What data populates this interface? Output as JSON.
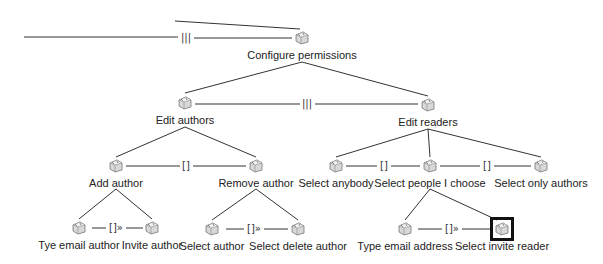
{
  "diagram": {
    "type": "feature-tree",
    "selected_node": "Select invite reader",
    "nodes": [
      {
        "id": "root",
        "label": "Configure permissions",
        "x": 302,
        "y": 38
      },
      {
        "id": "edit_authors",
        "label": "Edit authors",
        "x": 185,
        "y": 103
      },
      {
        "id": "edit_readers",
        "label": "Edit readers",
        "x": 428,
        "y": 105
      },
      {
        "id": "add_author",
        "label": "Add author",
        "x": 116,
        "y": 166
      },
      {
        "id": "remove_author",
        "label": "Remove author",
        "x": 256,
        "y": 166
      },
      {
        "id": "select_anybody",
        "label": "Select anybody",
        "x": 336,
        "y": 166
      },
      {
        "id": "select_people",
        "label": "Select people I choose",
        "x": 430,
        "y": 166
      },
      {
        "id": "select_only_authors",
        "label": "Select only authors",
        "x": 541,
        "y": 166
      },
      {
        "id": "tye_email_author",
        "label": "Tye email author",
        "x": 79,
        "y": 228
      },
      {
        "id": "invite_author",
        "label": "Invite author",
        "x": 152,
        "y": 228
      },
      {
        "id": "select_author",
        "label": "Select author",
        "x": 212,
        "y": 229
      },
      {
        "id": "select_delete_author",
        "label": "Select delete author",
        "x": 298,
        "y": 229
      },
      {
        "id": "type_email_address",
        "label": "Type email address",
        "x": 405,
        "y": 229
      },
      {
        "id": "select_invite_reader",
        "label": "Select invite reader",
        "x": 502,
        "y": 229
      }
    ],
    "operators": [
      {
        "symbol": "|||",
        "x": 186,
        "y": 38
      },
      {
        "symbol": "|||",
        "x": 307,
        "y": 104
      },
      {
        "symbol": "[]",
        "x": 186,
        "y": 166
      },
      {
        "symbol": "[]",
        "x": 384,
        "y": 166
      },
      {
        "symbol": "[]",
        "x": 487,
        "y": 166
      },
      {
        "symbol": "[]»",
        "x": 116,
        "y": 228
      },
      {
        "symbol": "[]»",
        "x": 254,
        "y": 229
      },
      {
        "symbol": "[]»",
        "x": 452,
        "y": 229
      }
    ]
  }
}
